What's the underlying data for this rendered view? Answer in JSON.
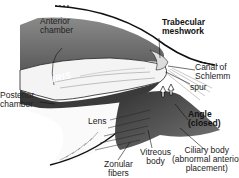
{
  "diagram": {
    "labels": {
      "anterior_chamber": "Anterior\nchamber",
      "trabecular_meshwork": "Trabecular\nmeshwork",
      "canal_of_schlemm": "Canal of\nSchlemm",
      "spur": "spur",
      "iris": "IRIS",
      "posterior_chamber": "Posterior\nchamber",
      "angle_closed": "Angle\n(closed)",
      "lens": "Lens",
      "ciliary_body": "Ciliary body\n(abnormal anterior\nplacement)",
      "vitreous_body": "Vitreous\nbody",
      "zonular_fibers": "Zonular\nfibers"
    },
    "colors": {
      "anterior_chamber_fill": "#6e6e6e",
      "iris_fill": "#3a3a3a",
      "outline": "#111111",
      "background": "#ffffff"
    }
  }
}
